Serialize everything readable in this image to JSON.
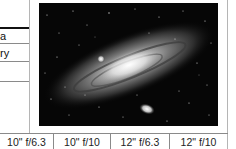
{
  "left_table": {
    "rows": [
      {
        "label": "a"
      },
      {
        "label": "ry"
      },
      {
        "label": ""
      }
    ]
  },
  "figure": {
    "icon": "galaxy-photo"
  },
  "bottom_row": {
    "cells": [
      {
        "label": "10\" f/6.3"
      },
      {
        "label": "10\" f/10"
      },
      {
        "label": "12\" f/6.3"
      },
      {
        "label": "12\" f/10"
      }
    ]
  }
}
